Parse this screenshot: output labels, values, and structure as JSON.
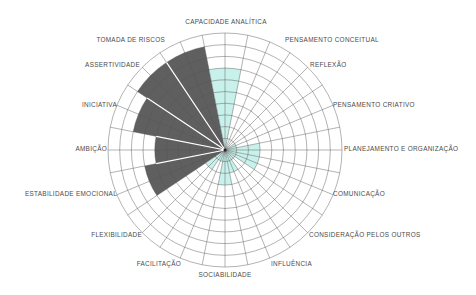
{
  "chart_data": {
    "type": "polar-area",
    "title": "",
    "center": [
      225,
      150
    ],
    "max_value": 10,
    "rings": 10,
    "categories": [
      "CAPACIDADE ANALÍTICA",
      "PENSAMENTO CONCEITUAL",
      "REFLEXÃO",
      "PENSAMENTO CRIATIVO",
      "PLANEJAMENTO E ORGANIZAÇÃO",
      "COMUNICAÇÃO",
      "CONSIDERAÇÃO PELOS OUTROS",
      "INFLUÊNCIA",
      "SOCIABILIDADE",
      "FACILITAÇÃO",
      "FLEXIBILIDADE",
      "ESTABILIDADE EMOCIONAL",
      "AMBIÇÃO",
      "INICIATIVA",
      "ASSERTIVIDADE",
      "TOMADA DE RISCOS"
    ],
    "series": [
      {
        "name": "perfil-cinza",
        "color": "#5f5f5f",
        "values": [
          0,
          0,
          0,
          0,
          0,
          0,
          0,
          0,
          0,
          0,
          0,
          7,
          6,
          8,
          9,
          9
        ]
      },
      {
        "name": "perfil-ciano",
        "color": "#c8f1ec",
        "values": [
          7,
          0,
          0,
          1,
          3,
          3,
          1,
          2,
          3,
          1,
          2,
          0,
          0,
          0,
          0,
          0
        ]
      }
    ],
    "grid": true,
    "legend": "none"
  },
  "labels": {
    "l0": "CAPACIDADE ANALÍTICA",
    "l1": "PENSAMENTO CONCEITUAL",
    "l2": "REFLEXÃO",
    "l3": "PENSAMENTO CRIATIVO",
    "l4": "PLANEJAMENTO E ORGANIZAÇÃO",
    "l5": "COMUNICAÇÃO",
    "l6": "CONSIDERAÇÃO PELOS OUTROS",
    "l7": "INFLUÊNCIA",
    "l8": "SOCIABILIDADE",
    "l9": "FACILITAÇÃO",
    "l10": "FLEXIBILIDADE",
    "l11": "ESTABILIDADE EMOCIONAL",
    "l12": "AMBIÇÃO",
    "l13": "INICIATIVA",
    "l14": "ASSERTIVIDADE",
    "l15": "TOMADA DE RISCOS"
  }
}
